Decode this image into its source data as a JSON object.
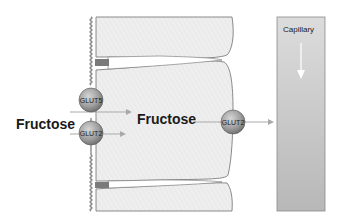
{
  "diagram": {
    "labels": {
      "fructose_lumen": "Fructose",
      "fructose_cell": "Fructose",
      "capillary": "Capillary"
    },
    "transporters": [
      {
        "id": "apical-top",
        "label": "GLUT5",
        "location": "apical membrane"
      },
      {
        "id": "apical-bottom",
        "label": "GLUT2",
        "location": "apical membrane"
      },
      {
        "id": "basolateral",
        "label": "GLUT2",
        "location": "basolateral membrane"
      }
    ],
    "colors": {
      "cell_fill": "#ececec",
      "cell_outline": "#6e6e6e",
      "capillary_fill": "#c8c8c8",
      "transporter_fill": "#a8a8a8",
      "arrow": "#a9a9a9",
      "background": "#ffffff"
    }
  }
}
